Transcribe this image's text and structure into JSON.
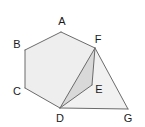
{
  "figure": {
    "background_color": "#ffffff",
    "stroke_color": "#6b6b6b",
    "label_color": "#1a1a1a",
    "fills": {
      "hexagon_face": "#eeeeee",
      "right_triangle_face": "#f1f1f1",
      "inner_triangle_face": "#d9d9d9"
    },
    "vertices": [
      {
        "id": "A",
        "label": "A",
        "x": 61,
        "y": 32,
        "label_x": 62,
        "label_y": 22
      },
      {
        "id": "B",
        "label": "B",
        "x": 25,
        "y": 50,
        "label_x": 17,
        "label_y": 45
      },
      {
        "id": "C",
        "label": "C",
        "x": 25,
        "y": 88,
        "label_x": 17,
        "label_y": 92
      },
      {
        "id": "D",
        "label": "D",
        "x": 60,
        "y": 108,
        "label_x": 60,
        "label_y": 119
      },
      {
        "id": "E",
        "label": "E",
        "x": 92,
        "y": 85,
        "label_x": 99,
        "label_y": 90
      },
      {
        "id": "F",
        "label": "F",
        "x": 95,
        "y": 48,
        "label_x": 98,
        "label_y": 40
      },
      {
        "id": "G",
        "label": "G",
        "x": 128,
        "y": 109,
        "label_x": 128,
        "label_y": 119
      }
    ],
    "faces": [
      {
        "id": "hexagon-ABCDEF",
        "name": "hexagon-face",
        "points": "61,32 25,50 25,88 60,108 92,85 95,48",
        "fill": "#eeeeee"
      },
      {
        "id": "triangle-DFG",
        "name": "right-triangle-face",
        "points": "60,108 95,48 128,109",
        "fill": "#f1f1f1"
      },
      {
        "id": "triangle-DFE",
        "name": "inner-shaded-triangle",
        "points": "60,108 95,48 92,85",
        "fill": "#d9d9d9"
      }
    ],
    "edges": [
      {
        "id": "edge-AB",
        "from": "A",
        "to": "B",
        "path": "M61,32 L25,50"
      },
      {
        "id": "edge-BC",
        "from": "B",
        "to": "C",
        "path": "M25,50 L25,88"
      },
      {
        "id": "edge-CD",
        "from": "C",
        "to": "D",
        "path": "M25,88 L60,108"
      },
      {
        "id": "edge-AF",
        "from": "A",
        "to": "F",
        "path": "M61,32 L95,48"
      },
      {
        "id": "edge-DG",
        "from": "D",
        "to": "G",
        "path": "M60,108 L128,109"
      },
      {
        "id": "edge-FG",
        "from": "F",
        "to": "G",
        "path": "M95,48 L128,109"
      },
      {
        "id": "edge-DF",
        "from": "D",
        "to": "F",
        "path": "M60,108 L95,48"
      },
      {
        "id": "edge-FE",
        "from": "F",
        "to": "E",
        "path": "M95,48 L92,85"
      },
      {
        "id": "edge-DE",
        "from": "D",
        "to": "E",
        "path": "M60,108 L92,85"
      },
      {
        "id": "edge-ED-hex",
        "from": "E",
        "to": "D",
        "path": "M92,85 L60,108"
      }
    ]
  }
}
